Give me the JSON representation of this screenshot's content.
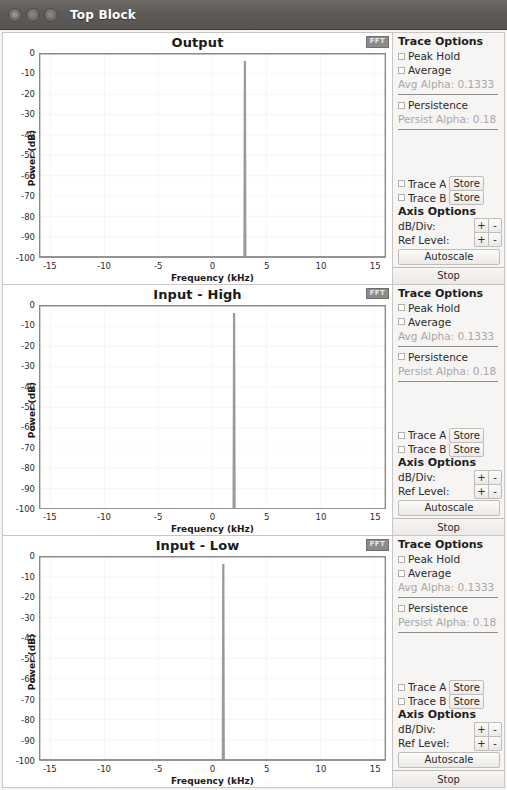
{
  "window": {
    "title": "Top Block",
    "buttons": [
      "close",
      "minimize",
      "maximize"
    ]
  },
  "controls": {
    "trace_options_label": "Trace Options",
    "peak_hold_label": "Peak Hold",
    "average_label": "Average",
    "avg_alpha_label": "Avg Alpha: 0.1333",
    "persistence_label": "Persistence",
    "persist_alpha_label": "Persist Alpha: 0.18",
    "trace_a_label": "Trace A",
    "trace_b_label": "Trace B",
    "store_label": "Store",
    "axis_options_label": "Axis Options",
    "db_div_label": "dB/Div:",
    "ref_level_label": "Ref Level:",
    "plus_label": "+",
    "minus_label": "-",
    "autoscale_label": "Autoscale",
    "stop_label": "Stop",
    "fft_badge_label": "FFT"
  },
  "chart_data": [
    {
      "type": "line",
      "title": "Output",
      "xlabel": "Frequency (kHz)",
      "ylabel": "Power (dB)",
      "xlim": [
        -16,
        16
      ],
      "ylim": [
        -100,
        0
      ],
      "xticks": [
        -15,
        -10,
        -5,
        0,
        5,
        10,
        15
      ],
      "xtick_labels": [
        "-15",
        "-10",
        "-5",
        "0",
        "5",
        "10",
        "15"
      ],
      "yticks": [
        0,
        -10,
        -20,
        -30,
        -40,
        -50,
        -60,
        -70,
        -80,
        -90,
        -100
      ],
      "ytick_labels": [
        "0",
        "-10",
        "-20",
        "-30",
        "-40",
        "-50",
        "-60",
        "-70",
        "-80",
        "-90",
        "-100"
      ],
      "grid": true,
      "noise_floor": -100,
      "peaks": [
        {
          "x": 3.0,
          "y": -4
        }
      ],
      "series_color": "#9a9a9a"
    },
    {
      "type": "line",
      "title": "Input - High",
      "xlabel": "Frequency (kHz)",
      "ylabel": "Power (dB)",
      "xlim": [
        -16,
        16
      ],
      "ylim": [
        -100,
        0
      ],
      "xticks": [
        -15,
        -10,
        -5,
        0,
        5,
        10,
        15
      ],
      "xtick_labels": [
        "-15",
        "-10",
        "-5",
        "0",
        "5",
        "10",
        "15"
      ],
      "yticks": [
        0,
        -10,
        -20,
        -30,
        -40,
        -50,
        -60,
        -70,
        -80,
        -90,
        -100
      ],
      "ytick_labels": [
        "0",
        "-10",
        "-20",
        "-30",
        "-40",
        "-50",
        "-60",
        "-70",
        "-80",
        "-90",
        "-100"
      ],
      "grid": true,
      "noise_floor": -100,
      "peaks": [
        {
          "x": 2.0,
          "y": -4
        }
      ],
      "series_color": "#9a9a9a"
    },
    {
      "type": "line",
      "title": "Input - Low",
      "xlabel": "Frequency (kHz)",
      "ylabel": "Power (dB)",
      "xlim": [
        -16,
        16
      ],
      "ylim": [
        -100,
        0
      ],
      "xticks": [
        -15,
        -10,
        -5,
        0,
        5,
        10,
        15
      ],
      "xtick_labels": [
        "-15",
        "-10",
        "-5",
        "0",
        "5",
        "10",
        "15"
      ],
      "yticks": [
        0,
        -10,
        -20,
        -30,
        -40,
        -50,
        -60,
        -70,
        -80,
        -90,
        -100
      ],
      "ytick_labels": [
        "0",
        "-10",
        "-20",
        "-30",
        "-40",
        "-50",
        "-60",
        "-70",
        "-80",
        "-90",
        "-100"
      ],
      "grid": true,
      "noise_floor": -100,
      "peaks": [
        {
          "x": 1.0,
          "y": -4
        }
      ],
      "series_color": "#9a9a9a"
    }
  ]
}
